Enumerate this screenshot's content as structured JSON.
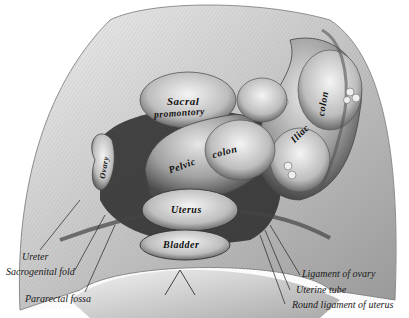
{
  "figure": {
    "style": "monochrome engraving",
    "colors": {
      "background": "#ffffff",
      "ink": "#1a1a1a",
      "shade_dark": "#3a3a3a",
      "shade_mid": "#8a8a8a",
      "shade_light": "#d8d8d8"
    }
  },
  "inline_labels": {
    "sacral_line1": "Sacral",
    "sacral_line2": "promontory",
    "pelvic": "Pelvic",
    "colon1": "colon",
    "iliac": "Iliac",
    "colon2": "colon",
    "ovary": "Ovary",
    "uterus": "Uterus",
    "bladder": "Bladder"
  },
  "callout_labels": {
    "ureter": "Ureter",
    "sacrogenital_fold": "Sacrogenital fold",
    "pararectal_fossa": "Pararectal fossa",
    "ligament_of_ovary": "Ligament of ovary",
    "uterine_tube": "Uterine tube",
    "round_ligament": "Round ligament of uterus"
  }
}
